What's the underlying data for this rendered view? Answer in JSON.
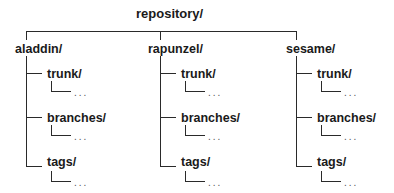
{
  "root": {
    "label": "repository/"
  },
  "projects": [
    {
      "name": "aladdin/",
      "children": [
        "trunk/",
        "branches/",
        "tags/"
      ]
    },
    {
      "name": "rapunzel/",
      "children": [
        "trunk/",
        "branches/",
        "tags/"
      ]
    },
    {
      "name": "sesame/",
      "children": [
        "trunk/",
        "branches/",
        "tags/"
      ]
    }
  ],
  "ellipsis": "...",
  "colors": {
    "line": "#2a2a2a",
    "text": "#1a1a1a",
    "background": "#ffffff"
  }
}
